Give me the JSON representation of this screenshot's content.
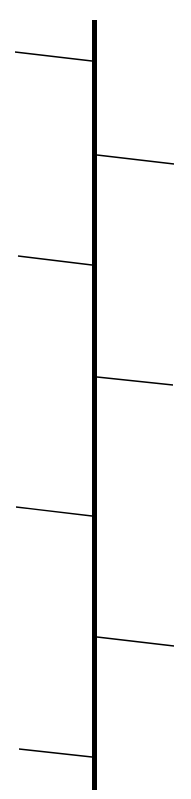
{
  "diagram": {
    "background": "#ffffff",
    "stroke_color": "#000000",
    "trunk": {
      "x": 94.5,
      "y1": 20,
      "y2": 790,
      "width": 5
    },
    "branches": [
      {
        "side": "left",
        "x1": 15,
        "y1": 52,
        "x2": 92,
        "y2": 61
      },
      {
        "side": "right",
        "x1": 97,
        "y1": 155,
        "x2": 174,
        "y2": 164
      },
      {
        "side": "left",
        "x1": 18,
        "y1": 256,
        "x2": 92,
        "y2": 265
      },
      {
        "side": "right",
        "x1": 97,
        "y1": 377,
        "x2": 173,
        "y2": 385
      },
      {
        "side": "left",
        "x1": 16,
        "y1": 507,
        "x2": 92,
        "y2": 516
      },
      {
        "side": "right",
        "x1": 97,
        "y1": 637,
        "x2": 174,
        "y2": 646
      },
      {
        "side": "left",
        "x1": 19,
        "y1": 749,
        "x2": 92,
        "y2": 757
      }
    ],
    "branch_width": 1.3
  }
}
